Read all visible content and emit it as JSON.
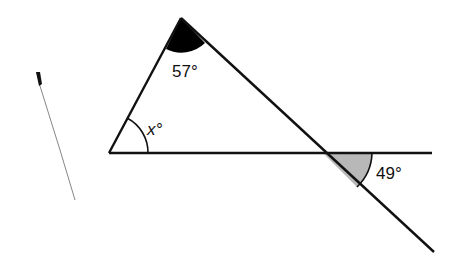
{
  "diagram": {
    "type": "geometry-angles",
    "angles": {
      "apex": {
        "label": "57°",
        "fill": "#000000"
      },
      "left": {
        "label": "x°"
      },
      "right_extension": {
        "label": "49°",
        "fill": "#b8b8b8"
      }
    },
    "colors": {
      "line": "#111111",
      "background": "#ffffff"
    }
  }
}
